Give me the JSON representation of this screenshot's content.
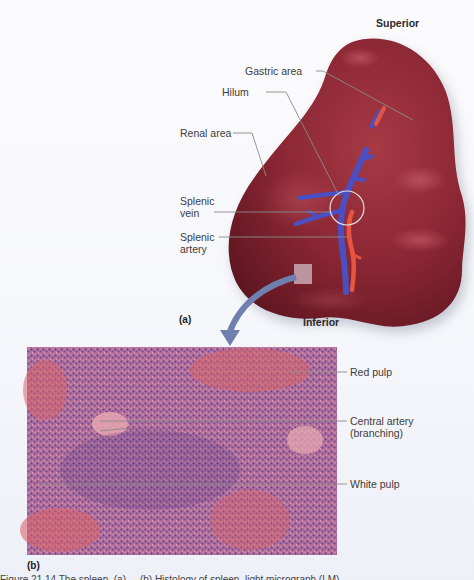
{
  "figure": {
    "panel_a": {
      "label": "(a)",
      "orientation": {
        "top": "Superior",
        "bottom": "Inferior"
      },
      "labels": [
        {
          "id": "gastric-area",
          "text": "Gastric area"
        },
        {
          "id": "hilum",
          "text": "Hilum"
        },
        {
          "id": "renal-area",
          "text": "Renal area"
        },
        {
          "id": "splenic-vein",
          "text": "Splenic\nvein",
          "lines": [
            "Splenic",
            "vein"
          ]
        },
        {
          "id": "splenic-artery",
          "text": "Splenic\nartery",
          "lines": [
            "Splenic",
            "artery"
          ]
        }
      ]
    },
    "panel_b": {
      "label": "(b)",
      "labels": [
        {
          "id": "red-pulp",
          "text": "Red pulp"
        },
        {
          "id": "central-artery",
          "text": "Central artery (branching)",
          "lines": [
            "Central artery",
            "(branching)"
          ]
        },
        {
          "id": "white-pulp",
          "text": "White pulp"
        }
      ]
    },
    "caption_fragment": "Figure 21.14 The spleen. (a) ... (b) Histology of spleen, light micrograph (LM)."
  },
  "colors": {
    "spleen": "#8e2a35",
    "spleen_highlight": "#b84a55",
    "vein": "#4a4fc4",
    "artery": "#e8553f",
    "arrow": "#6f7fb0",
    "leader_line": "#8a8a8a"
  }
}
